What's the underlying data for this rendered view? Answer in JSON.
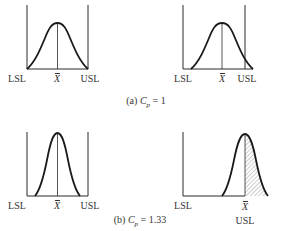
{
  "figure": {
    "panels": [
      {
        "id": "a-centered",
        "labels": {
          "left": "LSL",
          "center": "X",
          "right": "USL"
        },
        "description": "Process centered, spread equals tolerance"
      },
      {
        "id": "a-shifted",
        "labels": {
          "left": "LSL",
          "center": "X",
          "right": "USL"
        },
        "description": "Process shifted right, tail beyond USL"
      },
      {
        "id": "b-centered",
        "labels": {
          "left": "LSL",
          "center": "X",
          "right": "USL"
        },
        "description": "Process centered, narrower spread"
      },
      {
        "id": "b-shifted",
        "labels": {
          "left": "LSL",
          "center": "X",
          "right": "USL"
        },
        "description": "Process mean at USL, right half out of spec (hatched)"
      }
    ],
    "captions": {
      "a": {
        "prefix": "(a)",
        "symbol": "C",
        "subscript": "p",
        "equals": "=",
        "value": "1"
      },
      "b": {
        "prefix": "(b)",
        "symbol": "C",
        "subscript": "p",
        "equals": "=",
        "value": "1.33"
      }
    },
    "colors": {
      "line": "#2a2a2a",
      "hatch": "#9a9a9a",
      "background": "#ffffff"
    }
  }
}
